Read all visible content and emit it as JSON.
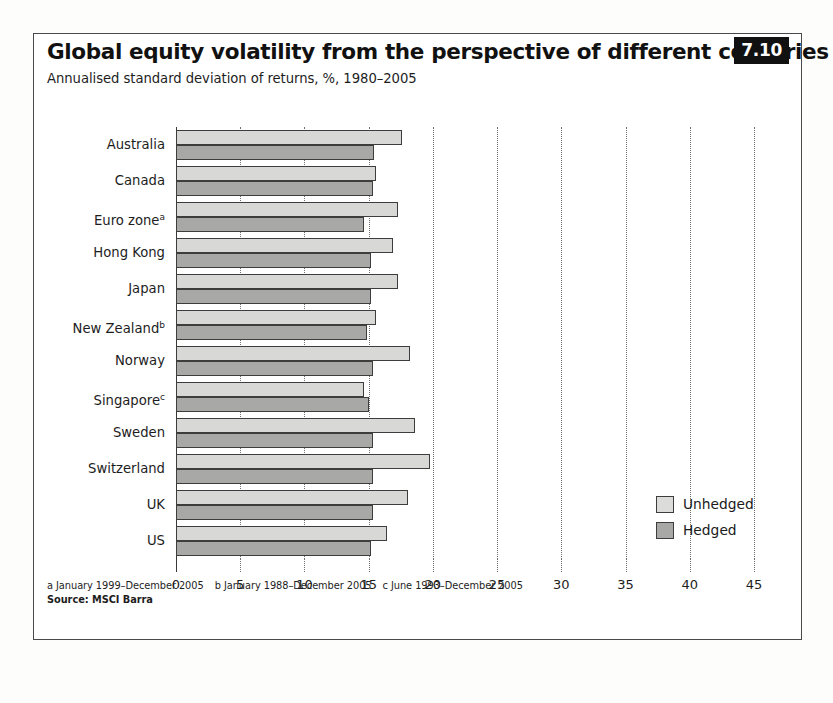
{
  "figure": {
    "badge": "7.10",
    "title": "Global equity volatility from the perspective of different countries",
    "subtitle": "Annualised standard deviation of returns, %, 1980–2005"
  },
  "footnotes": {
    "a": "a January 1999–December 2005",
    "b": "b January 1988–December 2005",
    "c": "c June 1993–December 2005",
    "source": "Source: MSCI Barra"
  },
  "legend": {
    "position": "inside-right",
    "items": [
      {
        "label": "Unhedged",
        "color": "#d8d8d6"
      },
      {
        "label": "Hedged",
        "color": "#a8a8a6"
      }
    ]
  },
  "chart_data": {
    "type": "bar",
    "orientation": "horizontal",
    "title": "Global equity volatility from the perspective of different countries",
    "subtitle": "Annualised standard deviation of returns, %, 1980–2005",
    "xlabel": "",
    "ylabel": "",
    "xlim": [
      0,
      45
    ],
    "xticks": [
      0,
      5,
      10,
      15,
      20,
      25,
      30,
      35,
      40,
      45
    ],
    "ticklabels": [
      "0",
      "5",
      "10",
      "15",
      "20",
      "25",
      "30",
      "35",
      "40",
      "45"
    ],
    "grid": "vertical-dotted",
    "categories": [
      "Australia",
      "Canada",
      "Euro zone",
      "Hong Kong",
      "Japan",
      "New Zealand",
      "Norway",
      "Singapore",
      "Sweden",
      "Switzerland",
      "UK",
      "US"
    ],
    "category_notes": [
      "",
      "",
      "a",
      "",
      "",
      "b",
      "",
      "c",
      "",
      "",
      "",
      ""
    ],
    "series": [
      {
        "name": "Unhedged",
        "color": "#d8d8d6",
        "values": [
          17.6,
          15.6,
          17.3,
          16.9,
          17.3,
          15.6,
          18.2,
          14.6,
          18.6,
          19.8,
          18.1,
          16.4
        ]
      },
      {
        "name": "Hedged",
        "color": "#a8a8a6",
        "values": [
          15.4,
          15.3,
          14.6,
          15.2,
          15.2,
          14.9,
          15.3,
          15.0,
          15.3,
          15.3,
          15.3,
          15.2
        ]
      }
    ]
  }
}
